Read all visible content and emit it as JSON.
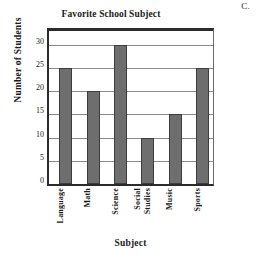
{
  "corner_label": "C.",
  "chart_data": {
    "type": "bar",
    "title": "Favorite School Subject",
    "xlabel": "Subject",
    "ylabel": "Number of Students",
    "categories": [
      "Language",
      "Math",
      "Science",
      "Social Studies",
      "Music",
      "Sports"
    ],
    "category_lines": [
      [
        "Language"
      ],
      [
        "Math"
      ],
      [
        "Science"
      ],
      [
        "Social",
        "Studies"
      ],
      [
        "Music"
      ],
      [
        "Sports"
      ]
    ],
    "values": [
      25,
      20,
      30,
      10,
      15,
      25
    ],
    "ylim": [
      0,
      33
    ],
    "yticks": [
      0,
      5,
      10,
      15,
      20,
      25,
      30
    ],
    "ytick_labels": [
      "0",
      "5",
      "10",
      "15",
      "20",
      "25",
      "30"
    ],
    "grid": true,
    "legend": false,
    "bar_color": "#6e6e6e",
    "bar_edge_color": "#3d3d3d",
    "grid_color": "#8a8a8a",
    "axis_color": "#2b2b2b",
    "background": "#ffffff"
  }
}
